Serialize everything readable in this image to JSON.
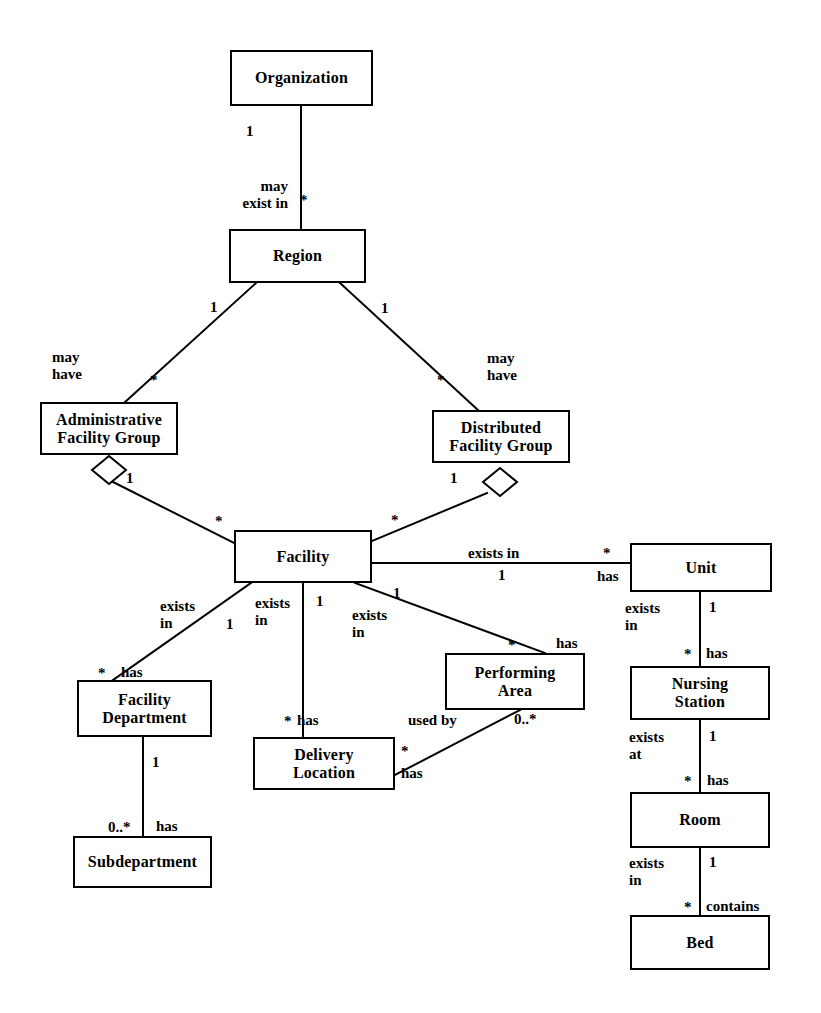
{
  "diagram": {
    "type": "uml-class-diagram",
    "canvas": {
      "width": 821,
      "height": 1013
    },
    "stroke_color": "#000000",
    "fill_color": "#ffffff"
  },
  "nodes": [
    {
      "id": "organization",
      "label": "Organization",
      "x": 230,
      "y": 50,
      "w": 143,
      "h": 56
    },
    {
      "id": "region",
      "label": "Region",
      "x": 229,
      "y": 229,
      "w": 137,
      "h": 54
    },
    {
      "id": "admin_facility_group",
      "label": "Administrative\nFacility Group",
      "x": 40,
      "y": 402,
      "w": 138,
      "h": 53
    },
    {
      "id": "dist_facility_group",
      "label": "Distributed\nFacility Group",
      "x": 432,
      "y": 410,
      "w": 138,
      "h": 53
    },
    {
      "id": "facility",
      "label": "Facility",
      "x": 234,
      "y": 530,
      "w": 138,
      "h": 53
    },
    {
      "id": "unit",
      "label": "Unit",
      "x": 630,
      "y": 543,
      "w": 142,
      "h": 49
    },
    {
      "id": "nursing_station",
      "label": "Nursing\nStation",
      "x": 630,
      "y": 666,
      "w": 140,
      "h": 54
    },
    {
      "id": "room",
      "label": "Room",
      "x": 630,
      "y": 792,
      "w": 140,
      "h": 56
    },
    {
      "id": "bed",
      "label": "Bed",
      "x": 630,
      "y": 915,
      "w": 140,
      "h": 55
    },
    {
      "id": "facility_department",
      "label": "Facility\nDepartment",
      "x": 77,
      "y": 680,
      "w": 135,
      "h": 57
    },
    {
      "id": "subdepartment",
      "label": "Subdepartment",
      "x": 73,
      "y": 836,
      "w": 139,
      "h": 52
    },
    {
      "id": "delivery_location",
      "label": "Delivery\nLocation",
      "x": 253,
      "y": 737,
      "w": 142,
      "h": 53
    },
    {
      "id": "performing_area",
      "label": "Performing\nArea",
      "x": 445,
      "y": 653,
      "w": 140,
      "h": 57
    }
  ],
  "relationships": [
    {
      "id": "organization-region",
      "from": "organization",
      "to": "region",
      "verb": "may\nexist in",
      "source_multiplicity": "1",
      "target_multiplicity": "*",
      "aggregation": false
    },
    {
      "id": "region-admin-facility-group",
      "from": "region",
      "to": "admin_facility_group",
      "verb": "may\nhave",
      "source_multiplicity": "1",
      "target_multiplicity": "*",
      "aggregation": false
    },
    {
      "id": "region-dist-facility-group",
      "from": "region",
      "to": "dist_facility_group",
      "verb": "may\nhave",
      "source_multiplicity": "1",
      "target_multiplicity": "*",
      "aggregation": false
    },
    {
      "id": "admin-facility-group-facility",
      "from": "admin_facility_group",
      "to": "facility",
      "verb": "",
      "source_multiplicity": "1",
      "target_multiplicity": "*",
      "aggregation": true
    },
    {
      "id": "dist-facility-group-facility",
      "from": "dist_facility_group",
      "to": "facility",
      "verb": "",
      "source_multiplicity": "1",
      "target_multiplicity": "*",
      "aggregation": true
    },
    {
      "id": "facility-unit",
      "from": "facility",
      "to": "unit",
      "verb": "exists in",
      "verb2": "has",
      "source_multiplicity": "1",
      "target_multiplicity": "*",
      "aggregation": false
    },
    {
      "id": "facility-facility-department",
      "from": "facility",
      "to": "facility_department",
      "verb": "exists\nin",
      "verb2": "has",
      "source_multiplicity": "1",
      "target_multiplicity": "*",
      "aggregation": false
    },
    {
      "id": "facility-delivery-location",
      "from": "facility",
      "to": "delivery_location",
      "verb": "exists\nin",
      "verb2": "has",
      "source_multiplicity": "1",
      "target_multiplicity": "*",
      "aggregation": false
    },
    {
      "id": "facility-performing-area",
      "from": "facility",
      "to": "performing_area",
      "verb": "exists\nin",
      "verb2": "has",
      "source_multiplicity": "1",
      "target_multiplicity": "*",
      "aggregation": false
    },
    {
      "id": "facility-department-subdepartment",
      "from": "facility_department",
      "to": "subdepartment",
      "verb": "has",
      "source_multiplicity": "1",
      "target_multiplicity": "0..*",
      "aggregation": false
    },
    {
      "id": "delivery-location-performing-area",
      "from": "delivery_location",
      "to": "performing_area",
      "verb": "used by",
      "verb2": "has",
      "source_multiplicity": "*",
      "target_multiplicity": "0..*",
      "aggregation": false
    },
    {
      "id": "unit-nursing-station",
      "from": "unit",
      "to": "nursing_station",
      "verb": "exists\nin",
      "verb2": "has",
      "source_multiplicity": "1",
      "target_multiplicity": "*",
      "aggregation": false
    },
    {
      "id": "nursing-station-room",
      "from": "nursing_station",
      "to": "room",
      "verb": "exists\nat",
      "verb2": "has",
      "source_multiplicity": "1",
      "target_multiplicity": "*",
      "aggregation": false
    },
    {
      "id": "room-bed",
      "from": "room",
      "to": "bed",
      "verb": "exists\nin",
      "verb2": "contains",
      "source_multiplicity": "1",
      "target_multiplicity": "*",
      "aggregation": false
    }
  ],
  "edge_labels": [
    {
      "id": "org-region-verb",
      "text": "may\nexist in",
      "x": 288,
      "y": 178,
      "align": "rt"
    },
    {
      "id": "org-region-src-mult",
      "text": "1",
      "x": 246,
      "y": 124,
      "align": "left"
    },
    {
      "id": "org-region-tgt-mult",
      "text": "*",
      "x": 300,
      "y": 193,
      "align": "left"
    },
    {
      "id": "region-afg-verb",
      "text": "may\nhave",
      "x": 52,
      "y": 349,
      "align": "left"
    },
    {
      "id": "region-afg-src-mult",
      "text": "1",
      "x": 210,
      "y": 300,
      "align": "left"
    },
    {
      "id": "region-afg-tgt-mult",
      "text": "*",
      "x": 150,
      "y": 373,
      "align": "left"
    },
    {
      "id": "region-dfg-verb",
      "text": "may\nhave",
      "x": 487,
      "y": 350,
      "align": "left"
    },
    {
      "id": "region-dfg-src-mult",
      "text": "1",
      "x": 381,
      "y": 301,
      "align": "left"
    },
    {
      "id": "region-dfg-tgt-mult",
      "text": "*",
      "x": 437,
      "y": 373,
      "align": "left"
    },
    {
      "id": "afg-facility-src-mult",
      "text": "1",
      "x": 126,
      "y": 471,
      "align": "left"
    },
    {
      "id": "afg-facility-tgt-mult",
      "text": "*",
      "x": 215,
      "y": 514,
      "align": "left"
    },
    {
      "id": "dfg-facility-src-mult",
      "text": "1",
      "x": 450,
      "y": 471,
      "align": "left"
    },
    {
      "id": "dfg-facility-tgt-mult",
      "text": "*",
      "x": 391,
      "y": 513,
      "align": "left"
    },
    {
      "id": "facility-unit-verb",
      "text": "exists in",
      "x": 468,
      "y": 545,
      "align": "left"
    },
    {
      "id": "facility-unit-src-mult",
      "text": "1",
      "x": 498,
      "y": 568,
      "align": "left"
    },
    {
      "id": "facility-unit-verb2",
      "text": "has",
      "x": 597,
      "y": 568,
      "align": "left"
    },
    {
      "id": "facility-unit-tgt-mult",
      "text": "*",
      "x": 603,
      "y": 546,
      "align": "left"
    },
    {
      "id": "facility-fd-verb",
      "text": "exists\nin",
      "x": 160,
      "y": 598,
      "align": "left"
    },
    {
      "id": "facility-fd-src-mult",
      "text": "1",
      "x": 226,
      "y": 617,
      "align": "left"
    },
    {
      "id": "facility-fd-verb2",
      "text": "has",
      "x": 121,
      "y": 664,
      "align": "left"
    },
    {
      "id": "facility-fd-tgt-mult",
      "text": "*",
      "x": 98,
      "y": 666,
      "align": "left"
    },
    {
      "id": "facility-dl-verb",
      "text": "exists\nin",
      "x": 255,
      "y": 595,
      "align": "left"
    },
    {
      "id": "facility-dl-src-mult",
      "text": "1",
      "x": 316,
      "y": 594,
      "align": "left"
    },
    {
      "id": "facility-dl-verb2",
      "text": "has",
      "x": 297,
      "y": 712,
      "align": "left"
    },
    {
      "id": "facility-dl-tgt-mult",
      "text": "*",
      "x": 284,
      "y": 714,
      "align": "left"
    },
    {
      "id": "facility-pa-verb",
      "text": "exists\nin",
      "x": 352,
      "y": 607,
      "align": "left"
    },
    {
      "id": "facility-pa-src-mult",
      "text": "1",
      "x": 393,
      "y": 586,
      "align": "left"
    },
    {
      "id": "facility-pa-verb2",
      "text": "has",
      "x": 556,
      "y": 635,
      "align": "left"
    },
    {
      "id": "facility-pa-tgt-mult",
      "text": "*",
      "x": 508,
      "y": 638,
      "align": "left"
    },
    {
      "id": "fd-sub-src-mult",
      "text": "1",
      "x": 152,
      "y": 755,
      "align": "left"
    },
    {
      "id": "fd-sub-verb",
      "text": "has",
      "x": 156,
      "y": 818,
      "align": "left"
    },
    {
      "id": "fd-sub-tgt-mult",
      "text": "0..*",
      "x": 108,
      "y": 820,
      "align": "left"
    },
    {
      "id": "dl-pa-verb",
      "text": "used by",
      "x": 408,
      "y": 712,
      "align": "left"
    },
    {
      "id": "dl-pa-src-mult",
      "text": "*",
      "x": 401,
      "y": 744,
      "align": "left"
    },
    {
      "id": "dl-pa-verb2",
      "text": "has",
      "x": 401,
      "y": 765,
      "align": "left"
    },
    {
      "id": "dl-pa-tgt-mult",
      "text": "0..*",
      "x": 514,
      "y": 712,
      "align": "left"
    },
    {
      "id": "unit-ns-verb",
      "text": "exists\nin",
      "x": 625,
      "y": 600,
      "align": "left"
    },
    {
      "id": "unit-ns-src-mult",
      "text": "1",
      "x": 709,
      "y": 600,
      "align": "left"
    },
    {
      "id": "unit-ns-verb2",
      "text": "has",
      "x": 706,
      "y": 645,
      "align": "left"
    },
    {
      "id": "unit-ns-tgt-mult",
      "text": "*",
      "x": 684,
      "y": 647,
      "align": "left"
    },
    {
      "id": "ns-room-verb",
      "text": "exists\nat",
      "x": 629,
      "y": 729,
      "align": "left"
    },
    {
      "id": "ns-room-src-mult",
      "text": "1",
      "x": 709,
      "y": 729,
      "align": "left"
    },
    {
      "id": "ns-room-verb2",
      "text": "has",
      "x": 707,
      "y": 772,
      "align": "left"
    },
    {
      "id": "ns-room-tgt-mult",
      "text": "*",
      "x": 684,
      "y": 774,
      "align": "left"
    },
    {
      "id": "room-bed-verb",
      "text": "exists\nin",
      "x": 629,
      "y": 855,
      "align": "left"
    },
    {
      "id": "room-bed-src-mult",
      "text": "1",
      "x": 709,
      "y": 855,
      "align": "left"
    },
    {
      "id": "room-bed-verb2",
      "text": "contains",
      "x": 706,
      "y": 898,
      "align": "left"
    },
    {
      "id": "room-bed-tgt-mult",
      "text": "*",
      "x": 684,
      "y": 900,
      "align": "left"
    }
  ],
  "lines": [
    {
      "id": "l-org-region",
      "x1": 301,
      "y1": 106,
      "x2": 301,
      "y2": 229
    },
    {
      "id": "l-region-afg",
      "x1": 256,
      "y1": 283,
      "x2": 125,
      "y2": 402
    },
    {
      "id": "l-region-dfg",
      "x1": 340,
      "y1": 283,
      "x2": 478,
      "y2": 410
    },
    {
      "id": "l-afg-facility",
      "x1": 113,
      "y1": 482,
      "x2": 234,
      "y2": 543
    },
    {
      "id": "l-dfg-facility",
      "x1": 487,
      "y1": 493,
      "x2": 372,
      "y2": 541
    },
    {
      "id": "l-facility-unit",
      "x1": 372,
      "y1": 563,
      "x2": 630,
      "y2": 563
    },
    {
      "id": "l-facility-fd",
      "x1": 251,
      "y1": 583,
      "x2": 113,
      "y2": 680
    },
    {
      "id": "l-facility-dl",
      "x1": 303,
      "y1": 583,
      "x2": 303,
      "y2": 737
    },
    {
      "id": "l-facility-pa",
      "x1": 355,
      "y1": 583,
      "x2": 545,
      "y2": 653
    },
    {
      "id": "l-fd-sub",
      "x1": 143,
      "y1": 737,
      "x2": 143,
      "y2": 836
    },
    {
      "id": "l-dl-pa",
      "x1": 395,
      "y1": 775,
      "x2": 520,
      "y2": 710
    },
    {
      "id": "l-unit-ns",
      "x1": 700,
      "y1": 592,
      "x2": 700,
      "y2": 666
    },
    {
      "id": "l-ns-room",
      "x1": 700,
      "y1": 720,
      "x2": 700,
      "y2": 792
    },
    {
      "id": "l-room-bed",
      "x1": 700,
      "y1": 848,
      "x2": 700,
      "y2": 915
    }
  ],
  "diamonds": [
    {
      "id": "d-afg",
      "cx": 109,
      "cy": 470,
      "rx": 17,
      "ry": 14
    },
    {
      "id": "d-dfg",
      "cx": 500,
      "cy": 482,
      "rx": 17,
      "ry": 14
    }
  ]
}
